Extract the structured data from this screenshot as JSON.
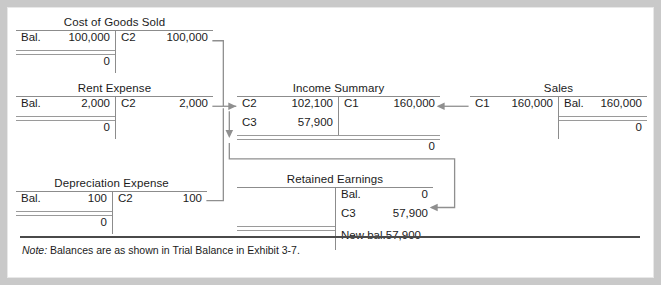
{
  "exhibit": {
    "note_lead": "Note:",
    "note_body": " Balances are as shown in Trial Balance in Exhibit 3-7."
  },
  "accounts": {
    "cogs": {
      "title": "Cost of Goods Sold",
      "debit_ref": "Bal.",
      "debit_amount": "100,000",
      "credit_ref": "C2",
      "credit_amount": "100,000",
      "debit_balance": "0"
    },
    "rent_expense": {
      "title": "Rent Expense",
      "debit_ref": "Bal.",
      "debit_amount": "2,000",
      "credit_ref": "C2",
      "credit_amount": "2,000",
      "debit_balance": "0"
    },
    "depreciation_expense": {
      "title": "Depreciation Expense",
      "debit_ref": "Bal.",
      "debit_amount": "100",
      "credit_ref": "C2",
      "credit_amount": "100",
      "debit_balance": "0"
    },
    "income_summary": {
      "title": "Income Summary",
      "debit_rows": [
        {
          "ref": "C2",
          "amount": "102,100"
        },
        {
          "ref": "C3",
          "amount": "57,900"
        }
      ],
      "credit_rows": [
        {
          "ref": "C1",
          "amount": "160,000"
        }
      ],
      "credit_balance": "0"
    },
    "sales": {
      "title": "Sales",
      "debit_ref": "C1",
      "debit_amount": "160,000",
      "credit_ref": "Bal.",
      "credit_amount": "160,000",
      "credit_balance": "0"
    },
    "retained_earnings": {
      "title": "Retained Earnings",
      "credit_rows": [
        {
          "ref": "Bal.",
          "amount": "0"
        },
        {
          "ref": "C3",
          "amount": "57,900"
        }
      ],
      "new_balance_label": "New bal.",
      "new_balance_amount": "57,900"
    }
  },
  "colors": {
    "frame": "#c9c9c9",
    "panel": "#ffffff",
    "rule": "#8c8c8c",
    "connector": "#8f8f8f",
    "note_rule": "#4a4a4a",
    "text": "#1b1b1b"
  }
}
